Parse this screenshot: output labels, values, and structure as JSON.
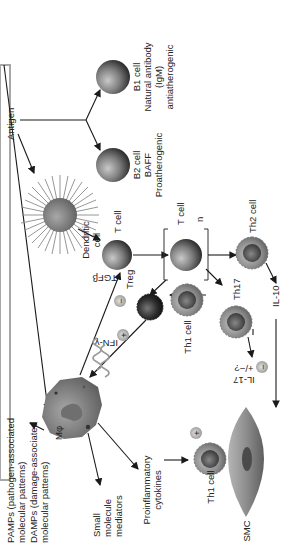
{
  "diagram": {
    "title_bar_color": "#a8a8a8",
    "nodes": {
      "pamps_line1": "PAMPs (pathogen-associated",
      "pamps_line2": "molecular patterns)",
      "damps_line1": "DAMPs (damage-associated",
      "damps_line2": "molecular patterns)",
      "antigen": "Antigen",
      "b2_cell": "B2 cell",
      "b2_baff": "BAFF",
      "b2_pro": "Proatherogenic",
      "b1_cell": "B1 cell",
      "b1_nat": "Natural antibody",
      "b1_igm": "(IgM)",
      "b1_anti": "antiatherogenic",
      "dendritic_line1": "Dendritic",
      "dendritic_line2": "cell",
      "t_cell": "T cell",
      "t_cell_n_label": "T cell",
      "t_cell_n": "n",
      "macrophage": "Mφ",
      "tgfb": "TGFβ",
      "ifng": "IFN-γ",
      "treg": "Treg",
      "th1_cell_mid": "Th1 cell",
      "th17": "Th17",
      "th2_cell": "Th2 cell",
      "il17_line1": "IL-17",
      "il17_line2": "+/−?",
      "il10": "IL-10",
      "small_line1": "Small",
      "small_line2": "molecule",
      "small_line3": "mediators",
      "proinf_line1": "Proinflammatory",
      "proinf_line2": "cytokines",
      "th1_cell_low": "Th1 cell",
      "smc": "SMC",
      "plus": "+",
      "minus": "−"
    }
  }
}
